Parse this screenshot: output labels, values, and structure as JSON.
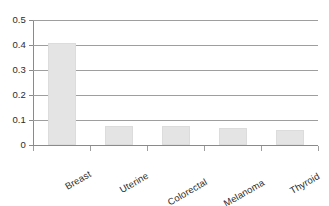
{
  "chart_data": {
    "type": "bar",
    "title": "",
    "subtitle": "",
    "xlabel": "",
    "ylabel": "",
    "categories": [
      "Breast",
      "Uterine",
      "Colorectal",
      "Melanoma",
      "Thyroid"
    ],
    "values": [
      0.41,
      0.077,
      0.077,
      0.068,
      0.06
    ],
    "series": [
      {
        "name": "",
        "values": [
          0.41,
          0.077,
          0.077,
          0.068,
          0.06
        ]
      }
    ],
    "ylim": [
      0,
      0.5
    ],
    "ytick_values": [
      0,
      0.1,
      0.2,
      0.3,
      0.4,
      0.5
    ],
    "ytick_labels": [
      "0",
      "0.1",
      "0.2",
      "0.3",
      "0.4",
      "0.5"
    ],
    "grid": true,
    "grid_axis": "y",
    "legend": false,
    "legend_position": "none",
    "annotations": [],
    "xtick_label_rotation": -30,
    "bar_color": "#e4e4e4",
    "bar_border_color": "#dcdcdc",
    "grid_color": "#9e9e9e",
    "axis_color": "#8a8a8a",
    "text_color": "#2b2b2b",
    "background_color": "#ffffff"
  }
}
